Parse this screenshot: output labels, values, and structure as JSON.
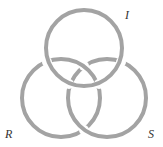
{
  "diagram": {
    "ring_color": "#a3a3a3",
    "label_color": "#333333",
    "stroke_width": 4,
    "rings": [
      {
        "id": "I",
        "label": "I",
        "cx": 84,
        "cy": 48,
        "r": 38,
        "label_x": 125,
        "label_y": 9
      },
      {
        "id": "R",
        "label": "R",
        "cx": 61,
        "cy": 98,
        "r": 39,
        "label_x": 6,
        "label_y": 128
      },
      {
        "id": "S",
        "label": "S",
        "cx": 107,
        "cy": 98,
        "r": 39,
        "label_x": 149,
        "label_y": 128
      }
    ]
  }
}
